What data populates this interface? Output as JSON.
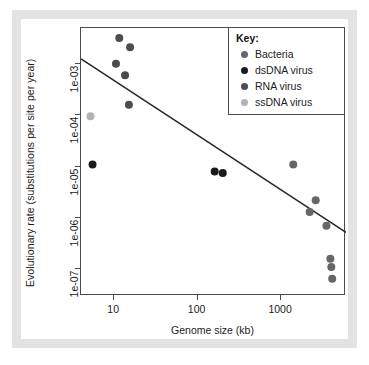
{
  "chart_data": {
    "type": "scatter",
    "title": "",
    "xlabel": "Genome size (kb)",
    "ylabel": "Evolutionary rate (substitutions per site per year)",
    "xscale": "log",
    "yscale": "log",
    "xlim": [
      4,
      6000
    ],
    "ylim": [
      3e-08,
      0.005
    ],
    "xticks": [
      10,
      100,
      1000
    ],
    "xticklabels": [
      "10",
      "100",
      "1000"
    ],
    "yticks": [
      0.001,
      0.0001,
      1e-05,
      1e-06,
      1e-07
    ],
    "yticklabels": [
      "1e-03",
      "1e-04",
      "1e-05",
      "1e-06",
      "1e-07"
    ],
    "grid": false,
    "legend_position": "top-right",
    "legend_title": "Key:",
    "series": [
      {
        "name": "Bacteria",
        "color": "#666666",
        "points": [
          {
            "x": 1400,
            "y": 1.1e-05
          },
          {
            "x": 2600,
            "y": 2.2e-06
          },
          {
            "x": 2200,
            "y": 1.3e-06
          },
          {
            "x": 3500,
            "y": 7e-07
          },
          {
            "x": 3900,
            "y": 1.6e-07
          },
          {
            "x": 4000,
            "y": 1.1e-07
          },
          {
            "x": 4100,
            "y": 6.5e-08
          }
        ]
      },
      {
        "name": "dsDNA virus",
        "color": "#1a1a1a",
        "points": [
          {
            "x": 5.5,
            "y": 1.1e-05
          },
          {
            "x": 160,
            "y": 8e-06
          },
          {
            "x": 200,
            "y": 7.5e-06
          }
        ]
      },
      {
        "name": "RNA virus",
        "color": "#4d4d4d",
        "points": [
          {
            "x": 11.5,
            "y": 0.0032
          },
          {
            "x": 15.5,
            "y": 0.0021
          },
          {
            "x": 10.5,
            "y": 0.001
          },
          {
            "x": 13.5,
            "y": 0.0006
          },
          {
            "x": 15.0,
            "y": 0.00016
          }
        ]
      },
      {
        "name": "ssDNA virus",
        "color": "#b3b3b3",
        "points": [
          {
            "x": 5.2,
            "y": 9.5e-05
          }
        ]
      }
    ],
    "trendline": {
      "name": "regression-line",
      "color": "#262626",
      "x_start": 4.0,
      "y_start": 0.00125,
      "x_end": 6000,
      "y_end": 5.2e-07
    }
  },
  "axis": {
    "y_label": "Evolutionary rate (substitutions per site per year)",
    "x_label": "Genome size (kb)",
    "y_ticks": [
      "1e-03",
      "1e-04",
      "1e-05",
      "1e-06",
      "1e-07"
    ],
    "x_ticks": [
      "10",
      "100",
      "1000"
    ]
  },
  "legend": {
    "title": "Key:",
    "items": [
      {
        "label": "Bacteria",
        "color": "#666666"
      },
      {
        "label": "dsDNA virus",
        "color": "#1a1a1a"
      },
      {
        "label": "RNA virus",
        "color": "#4d4d4d"
      },
      {
        "label": "ssDNA virus",
        "color": "#b3b3b3"
      }
    ]
  }
}
